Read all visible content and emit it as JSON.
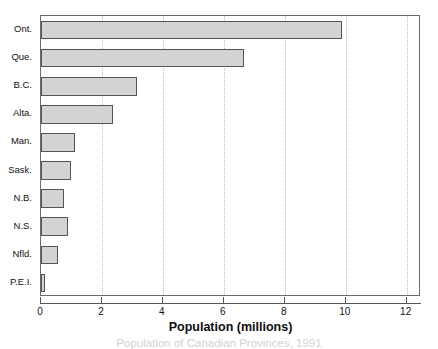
{
  "chart_data": {
    "type": "bar",
    "orientation": "horizontal",
    "title": "",
    "xlabel": "Population (millions)",
    "ylabel": "",
    "categories": [
      "Ont.",
      "Que.",
      "B.C.",
      "Alta.",
      "Man.",
      "Sask.",
      "N.B.",
      "N.S.",
      "Nfld.",
      "P.E.I."
    ],
    "values": [
      9.87,
      6.66,
      3.15,
      2.36,
      1.11,
      1.0,
      0.74,
      0.9,
      0.57,
      0.13
    ],
    "xlim": [
      0,
      12.47
    ],
    "xticks": [
      0,
      2,
      4,
      6,
      8,
      10,
      12
    ],
    "xticklabels": [
      "0",
      "2",
      "4",
      "6",
      "8",
      "10",
      "12"
    ],
    "grid": "vertical-dotted",
    "legend": "none",
    "bar_fill_color": "#d3d3d3",
    "bar_edge_color": "#555555",
    "gridline_color": "#b9b9b9",
    "axis_color": "#555555"
  },
  "caption": {
    "text": "Population of Canadian Provinces, 1991"
  }
}
